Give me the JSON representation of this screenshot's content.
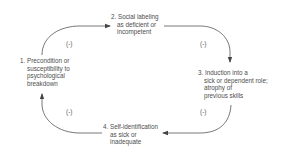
{
  "diagram": {
    "type": "cycle",
    "nodes": [
      {
        "id": 1,
        "lines": [
          "1. Precondition or",
          "susceptibility to",
          "psychological",
          "breakdown"
        ]
      },
      {
        "id": 2,
        "lines": [
          "2. Social labeling",
          "as deficient or",
          "incompetent"
        ]
      },
      {
        "id": 3,
        "lines": [
          "3. Induction into a",
          "sick or dependent role;",
          "atrophy of",
          "previous skills"
        ]
      },
      {
        "id": 4,
        "lines": [
          "4. Self-identification",
          "as sick or",
          "inadequate"
        ]
      }
    ],
    "edges": [
      {
        "from": 1,
        "to": 2,
        "label": "(-)"
      },
      {
        "from": 2,
        "to": 3,
        "label": "(-)"
      },
      {
        "from": 3,
        "to": 4,
        "label": "(-)"
      },
      {
        "from": 4,
        "to": 1,
        "label": "(-)"
      }
    ],
    "colors": {
      "line": "#555555",
      "text": "#4d4d4d"
    }
  }
}
